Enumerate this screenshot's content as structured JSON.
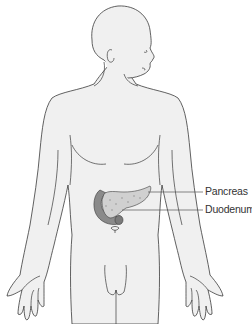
{
  "figure": {
    "labels": [
      {
        "id": "pancreas",
        "text": "Pancreas"
      },
      {
        "id": "duodenum",
        "text": "Duodenum"
      }
    ],
    "colors": {
      "body_fill": "#f0f0f0",
      "outline": "#3a3a3a",
      "pancreas": "#cfcfcf",
      "duodenum": "#8a8a8a",
      "leader_line": "#555555"
    }
  }
}
